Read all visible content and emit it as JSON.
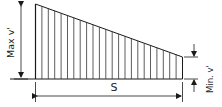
{
  "diagram": {
    "type": "trapezoidal-distribution",
    "labels": {
      "max": "Max v'",
      "min": "Min. v'",
      "span": "S"
    },
    "colors": {
      "line": "#1a1a1a",
      "background": "#ffffff"
    },
    "hatch_count": 22
  }
}
